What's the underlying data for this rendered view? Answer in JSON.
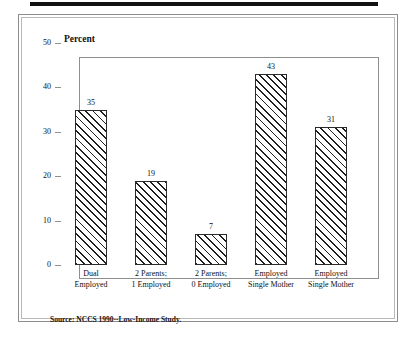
{
  "figure": {
    "top_rule": "decorative-rule",
    "source_note": "Source: NCCS 1990--Low-Income Study."
  },
  "chart_data": {
    "type": "bar",
    "title": "",
    "subtitle": "",
    "xlabel": "",
    "ylabel": "Percent",
    "ylim": [
      0,
      50
    ],
    "yticks": [
      0,
      10,
      20,
      30,
      40,
      50
    ],
    "ytick_labels": [
      "0",
      "10",
      "20",
      "30",
      "40",
      "50"
    ],
    "grid": false,
    "legend": null,
    "categories": [
      "Dual Employed",
      "2 Parents; 1 Employed",
      "2 Parents; 0 Employed",
      "Employed Single Mother",
      "Employed Single Mother"
    ],
    "category_lines": [
      [
        "Dual",
        "Employed"
      ],
      [
        "2 Parents;",
        "1 Employed"
      ],
      [
        "2 Parents;",
        "0 Employed"
      ],
      [
        "Employed",
        "Single Mother"
      ],
      [
        "Employed",
        "Single Mother"
      ]
    ],
    "values": [
      35,
      19,
      7,
      43,
      31
    ],
    "value_labels": [
      "35",
      "19",
      "7",
      "43",
      "31"
    ],
    "bar_fill": "diagonal-hatch",
    "bar_edge_color": "#1e1e1e",
    "bar_face_color": "#ffffff"
  }
}
